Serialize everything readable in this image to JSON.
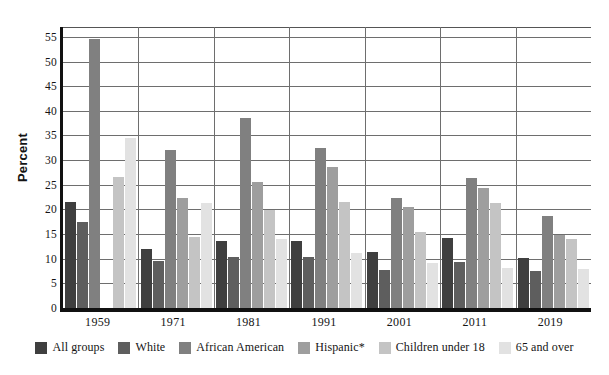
{
  "chart_data": {
    "type": "bar",
    "title": "",
    "xlabel": "",
    "ylabel": "Percent",
    "ylim": [
      0,
      57
    ],
    "ytick_step": 5,
    "grid": true,
    "legend_position": "bottom",
    "categories": [
      "1959",
      "1971",
      "1981",
      "1991",
      "2001",
      "2011",
      "2019"
    ],
    "yticks": [
      "0",
      "5",
      "10",
      "15",
      "20",
      "25",
      "30",
      "35",
      "40",
      "45",
      "50",
      "55"
    ],
    "series": [
      {
        "name": "All groups",
        "color": "#3f3f3f",
        "values": [
          21.5,
          11.9,
          13.5,
          13.5,
          11.3,
          14.3,
          10.2
        ]
      },
      {
        "name": "White",
        "color": "#5e5e5e",
        "values": [
          17.4,
          9.5,
          10.4,
          10.4,
          7.7,
          9.4,
          7.5
        ]
      },
      {
        "name": "African American",
        "color": "#808080",
        "values": [
          54.5,
          32.1,
          38.5,
          32.4,
          22.3,
          26.4,
          18.6
        ]
      },
      {
        "name": "Hispanic*",
        "color": "#9e9e9e",
        "values": [
          null,
          22.3,
          25.5,
          28.6,
          20.4,
          24.4,
          14.9
        ]
      },
      {
        "name": "Children under 18",
        "color": "#c4c4c4",
        "values": [
          26.5,
          14.5,
          19.9,
          21.6,
          15.4,
          21.3,
          14.0
        ]
      },
      {
        "name": "65 and over",
        "color": "#e2e2e2",
        "values": [
          34.5,
          21.3,
          14.0,
          11.2,
          9.2,
          8.1,
          8.0
        ]
      }
    ]
  },
  "axis": {
    "y_title": "Percent"
  },
  "legend": {
    "items": [
      {
        "label": "All groups",
        "color": "#3f3f3f"
      },
      {
        "label": "White",
        "color": "#5e5e5e"
      },
      {
        "label": "African American",
        "color": "#808080"
      },
      {
        "label": "Hispanic*",
        "color": "#9e9e9e"
      },
      {
        "label": "Children under 18",
        "color": "#c4c4c4"
      },
      {
        "label": "65 and over",
        "color": "#e2e2e2"
      }
    ]
  }
}
